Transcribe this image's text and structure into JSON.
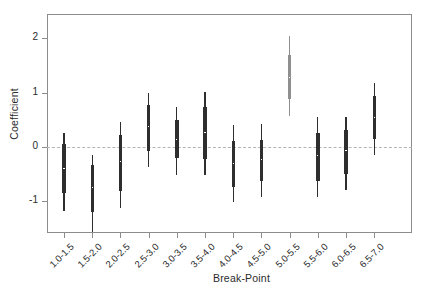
{
  "chart_data": {
    "type": "line",
    "plot_style": "credible-interval forest plot",
    "title": "",
    "xlabel": "Break-Point",
    "ylabel": "Coefficient",
    "ylim": [
      -1.48,
      2.38
    ],
    "yticks": [
      -1,
      0,
      1,
      2
    ],
    "ytick_labels": [
      "-1",
      "0",
      "1",
      "2"
    ],
    "grid": false,
    "legend": "none",
    "reference_line": {
      "value": 0,
      "style": "dashed",
      "color": "#b4b4b4"
    },
    "categories": [
      "1.0-1.5",
      "1.5-2.0",
      "2.0-2.5",
      "2.5-3.0",
      "3.0-3.5",
      "3.5-4.0",
      "4.0-4.5",
      "4.5-5.0",
      "5.0-5.5",
      "5.5-6.0",
      "6.0-6.5",
      "6.5-7.0"
    ],
    "series": [
      {
        "name": "Coefficient estimate",
        "median": [
          -0.39,
          -0.75,
          -0.27,
          0.37,
          0.14,
          0.27,
          -0.31,
          -0.23,
          1.28,
          -0.16,
          -0.06,
          0.54
        ],
        "inner_lower": [
          -0.84,
          -1.19,
          -0.81,
          -0.07,
          -0.21,
          -0.22,
          -0.73,
          -0.62,
          0.88,
          -0.63,
          -0.5,
          0.15
        ],
        "inner_upper": [
          0.06,
          -0.33,
          0.23,
          0.77,
          0.49,
          0.73,
          0.11,
          0.13,
          1.7,
          0.26,
          0.32,
          0.94
        ],
        "outer_lower": [
          -1.18,
          -1.56,
          -1.13,
          -0.37,
          -0.52,
          -0.52,
          -1.02,
          -0.93,
          0.57,
          -0.93,
          -0.79,
          -0.15
        ],
        "outer_upper": [
          0.26,
          -0.14,
          0.46,
          0.99,
          0.73,
          1.02,
          0.41,
          0.42,
          2.05,
          0.55,
          0.55,
          1.17
        ]
      }
    ],
    "colors": {
      "default_interval": "#2e2e2e",
      "highlight_interval": "#8f8f8f",
      "point_fill": "#ffffff",
      "axis": "#8c8c8c",
      "reference_line": "#b4b4b4",
      "text": "#2b2b2b"
    },
    "highlighted_category": "5.0-5.5",
    "background": "#ffffff"
  }
}
